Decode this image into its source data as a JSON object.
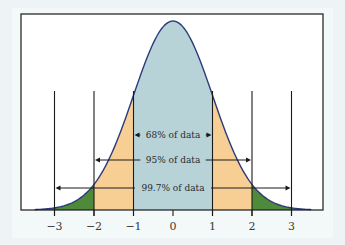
{
  "chart_data": {
    "type": "area",
    "title": "",
    "xlabel": "",
    "ylabel": "",
    "distribution": "standard normal",
    "mean": 0,
    "sd": 1,
    "xlim": [
      -3.5,
      3.5
    ],
    "x_ticks": [
      -3,
      -2,
      -1,
      0,
      1,
      2,
      3
    ],
    "x_tick_labels": [
      "−3",
      "−2",
      "−1",
      "0",
      "1",
      "2",
      "3"
    ],
    "vertical_guides_at": [
      -3,
      -2,
      -1,
      1,
      2,
      3
    ],
    "regions": [
      {
        "name": "within 1 SD",
        "from": -1,
        "to": 1,
        "color": "#b7d3d8"
      },
      {
        "name": "1 to 2 SD",
        "from": -2,
        "to": -1,
        "color": "#f7cf94"
      },
      {
        "name": "1 to 2 SD",
        "from": 1,
        "to": 2,
        "color": "#f7cf94"
      },
      {
        "name": "2 to 3+ SD",
        "from": -3.5,
        "to": -2,
        "color": "#4e8a3a"
      },
      {
        "name": "2 to 3+ SD",
        "from": 2,
        "to": 3.5,
        "color": "#4e8a3a"
      }
    ],
    "annotations": [
      {
        "label": "68% of data",
        "from": -1,
        "to": 1,
        "percent": 68
      },
      {
        "label": "95% of data",
        "from": -2,
        "to": 2,
        "percent": 95
      },
      {
        "label": "99.7% of data",
        "from": -3,
        "to": 3,
        "percent": 99.7
      }
    ],
    "curve_color": "#2d3a7a",
    "grid": false,
    "legend": "none"
  }
}
